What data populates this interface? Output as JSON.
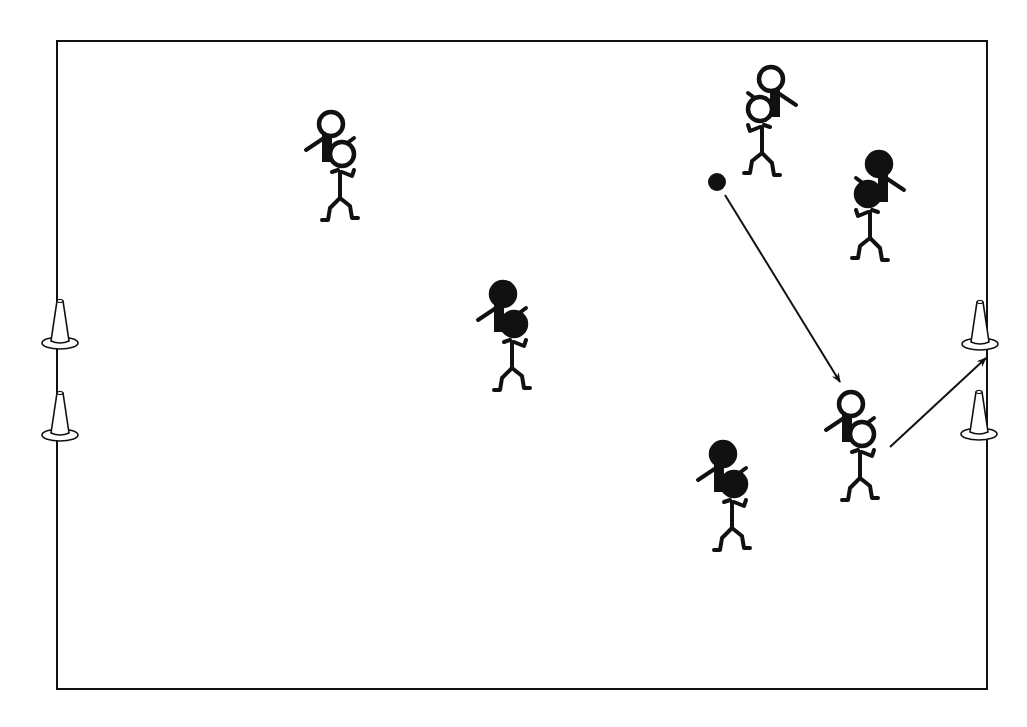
{
  "diagram": {
    "type": "sports-drill",
    "background": "#ffffff",
    "ink": "#111111",
    "field": {
      "x": 57,
      "y": 41,
      "width": 930,
      "height": 648
    },
    "cones": [
      {
        "id": "left-top",
        "x": 60,
        "y": 345
      },
      {
        "id": "left-bottom",
        "x": 60,
        "y": 437
      },
      {
        "id": "right-top",
        "x": 980,
        "y": 346
      },
      {
        "id": "right-bottom",
        "x": 979,
        "y": 436
      }
    ],
    "ball": {
      "x": 717,
      "y": 182,
      "r": 9
    },
    "arrows": [
      {
        "id": "pass",
        "x1": 725,
        "y1": 195,
        "x2": 840,
        "y2": 382
      },
      {
        "id": "shot",
        "x1": 890,
        "y1": 447,
        "x2": 986,
        "y2": 358
      }
    ],
    "players": [
      {
        "id": "white-pair-top-left",
        "team": "white",
        "x": 340,
        "y": 160,
        "facing": "left"
      },
      {
        "id": "white-pair-top-right",
        "team": "white",
        "x": 762,
        "y": 115,
        "facing": "right",
        "mirrored": true
      },
      {
        "id": "black-pair-right",
        "team": "black",
        "x": 870,
        "y": 200,
        "facing": "right",
        "mirrored": true
      },
      {
        "id": "black-pair-center",
        "team": "black",
        "x": 512,
        "y": 330,
        "facing": "left"
      },
      {
        "id": "white-pair-bottom-right",
        "team": "white",
        "x": 860,
        "y": 440,
        "facing": "left"
      },
      {
        "id": "black-pair-bottom",
        "team": "black",
        "x": 732,
        "y": 490,
        "facing": "left"
      }
    ]
  }
}
